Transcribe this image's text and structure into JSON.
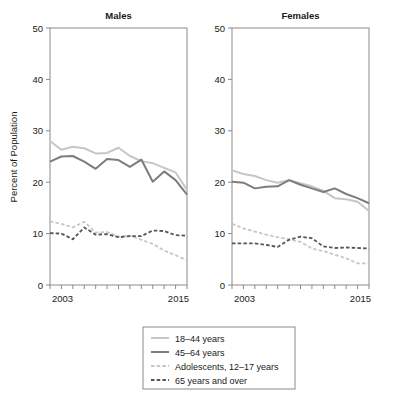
{
  "figure": {
    "y_axis_title": "Percent of Population",
    "panels": [
      {
        "key": "males",
        "title": "Males"
      },
      {
        "key": "females",
        "title": "Females"
      }
    ],
    "y_ticks": [
      "0",
      "10",
      "20",
      "30",
      "40",
      "50"
    ],
    "x_tick_labels": [
      "2003",
      "2015"
    ]
  },
  "legend": {
    "entries": [
      {
        "label": "18–44 years",
        "style": "solid",
        "color": "#c6c6c6"
      },
      {
        "label": "45–64 years",
        "style": "solid",
        "color": "#7d7d7d"
      },
      {
        "label": "Adolescents, 12–17 years",
        "style": "dashed",
        "color": "#c6c6c6"
      },
      {
        "label": "65 years and over",
        "style": "dashed",
        "color": "#555555"
      }
    ]
  },
  "chart_data": {
    "type": "line",
    "title": "",
    "subtitle": "",
    "xlabel": "",
    "ylabel": "Percent of Population",
    "xlim": [
      2003,
      2015
    ],
    "ylim": [
      0,
      50
    ],
    "yticks": [
      0,
      10,
      20,
      30,
      40,
      50
    ],
    "xticks": [
      2003,
      2004,
      2005,
      2006,
      2007,
      2008,
      2009,
      2010,
      2011,
      2012,
      2013,
      2014,
      2015
    ],
    "xtick_labels_shown": [
      "2003",
      "2015"
    ],
    "grid": false,
    "legend_position": "below",
    "x": [
      2003,
      2004,
      2005,
      2006,
      2007,
      2008,
      2009,
      2010,
      2011,
      2012,
      2013,
      2014,
      2015
    ],
    "panels": [
      {
        "name": "Males",
        "series": [
          {
            "name": "18–44 years",
            "color": "#c6c6c6",
            "style": "solid",
            "values": [
              28.0,
              26.3,
              26.9,
              26.6,
              25.6,
              25.7,
              26.7,
              25.1,
              24.1,
              23.7,
              22.8,
              21.9,
              18.5
            ]
          },
          {
            "name": "45–64 years",
            "color": "#7d7d7d",
            "style": "solid",
            "values": [
              24.0,
              25.0,
              25.1,
              24.0,
              22.6,
              24.5,
              24.3,
              23.0,
              24.4,
              20.1,
              22.1,
              20.4,
              17.6
            ]
          },
          {
            "name": "Adolescents, 12–17 years",
            "color": "#c6c6c6",
            "style": "dashed",
            "values": [
              12.4,
              11.9,
              11.2,
              12.3,
              10.2,
              10.3,
              9.4,
              9.6,
              8.8,
              8.0,
              6.7,
              5.8,
              4.8
            ]
          },
          {
            "name": "65 years and over",
            "color": "#555555",
            "style": "dashed",
            "values": [
              10.1,
              10.0,
              8.9,
              11.2,
              9.8,
              9.9,
              9.3,
              9.5,
              9.5,
              10.6,
              10.5,
              9.7,
              9.6
            ]
          }
        ]
      },
      {
        "name": "Females",
        "series": [
          {
            "name": "18–44 years",
            "color": "#c6c6c6",
            "style": "solid",
            "values": [
              22.3,
              21.6,
              21.2,
              20.4,
              19.9,
              20.4,
              19.8,
              19.2,
              18.3,
              16.9,
              16.7,
              16.2,
              14.4
            ]
          },
          {
            "name": "45–64 years",
            "color": "#7d7d7d",
            "style": "solid",
            "values": [
              20.1,
              19.9,
              18.8,
              19.1,
              19.2,
              20.4,
              19.5,
              18.8,
              18.1,
              18.8,
              17.7,
              16.9,
              15.9
            ]
          },
          {
            "name": "Adolescents, 12–17 years",
            "color": "#c6c6c6",
            "style": "dashed",
            "values": [
              11.9,
              11.0,
              10.4,
              9.8,
              9.3,
              8.9,
              8.4,
              7.1,
              6.6,
              5.9,
              5.2,
              4.2,
              4.2
            ]
          },
          {
            "name": "65 years and over",
            "color": "#555555",
            "style": "dashed",
            "values": [
              8.1,
              8.1,
              8.1,
              7.8,
              7.4,
              8.8,
              9.4,
              9.1,
              7.5,
              7.2,
              7.3,
              7.2,
              7.1
            ]
          }
        ]
      }
    ]
  }
}
